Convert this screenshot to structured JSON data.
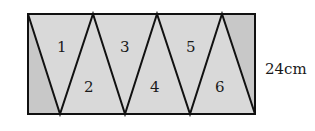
{
  "figure": {
    "type": "rectangle-divided-into-triangles",
    "triangle_labels": [
      "1",
      "2",
      "3",
      "4",
      "5",
      "6"
    ],
    "dimension_label": "24cm",
    "colors": {
      "fill_triangles": "#d9d9d9",
      "fill_corners": "#c8c8c8",
      "stroke": "#111111"
    }
  }
}
